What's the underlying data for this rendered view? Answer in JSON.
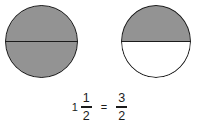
{
  "figure": {
    "background_color": "#ffffff",
    "shaded_color": "#939393",
    "unshaded_color": "#ffffff",
    "line_color": "#1b1b1b"
  },
  "models": [
    {
      "name": "first-whole-circle",
      "label": "1",
      "top_half": "shaded",
      "bottom_half": "shaded",
      "shaded_parts": 2,
      "total_parts": 2
    },
    {
      "name": "second-half-circle",
      "label": "1/2",
      "top_half": "shaded",
      "bottom_half": "unshaded",
      "shaded_parts": 1,
      "total_parts": 2
    }
  ],
  "equation": {
    "mixed_number": {
      "whole": "1",
      "numerator": "1",
      "denominator": "2"
    },
    "operator": "=",
    "improper_fraction": {
      "numerator": "3",
      "denominator": "2"
    }
  }
}
